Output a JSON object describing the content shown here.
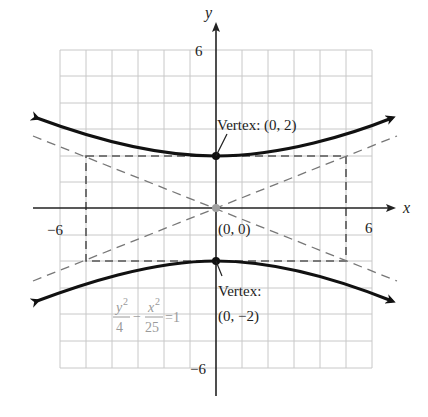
{
  "diagram": {
    "type": "hyperbola-graph",
    "axes": {
      "x_label": "x",
      "y_label": "y",
      "x_tick_neg": "−6",
      "x_tick_pos": "6",
      "y_tick_pos": "6",
      "y_tick_neg": "−6",
      "range": [
        -6,
        6
      ]
    },
    "equation": {
      "num1": "y",
      "exp1": "2",
      "den1": "4",
      "minus": "−",
      "num2": "x",
      "exp2": "2",
      "den2": "25",
      "rhs": "=1"
    },
    "labels": {
      "vertex_top": "Vertex: (0, 2)",
      "center": "(0, 0)",
      "vertex_bottom_line1": "Vertex:",
      "vertex_bottom_line2": "(0, −2)"
    },
    "points": [
      {
        "name": "vertex-top",
        "x": 0,
        "y": 2
      },
      {
        "name": "center",
        "x": 0,
        "y": 0
      },
      {
        "name": "vertex-bottom",
        "x": 0,
        "y": -2
      }
    ],
    "fundamental_rectangle": {
      "x": [
        -5,
        5
      ],
      "y": [
        -2,
        2
      ]
    },
    "asymptotes": [
      "y = 2/5 x",
      "y = -2/5 x"
    ],
    "colors": {
      "curve": "#111111",
      "grid": "#c8c8c8",
      "dashed": "#6e6e6e",
      "center_point": "#a0a0a0",
      "equation": "#9a9a9a"
    }
  }
}
